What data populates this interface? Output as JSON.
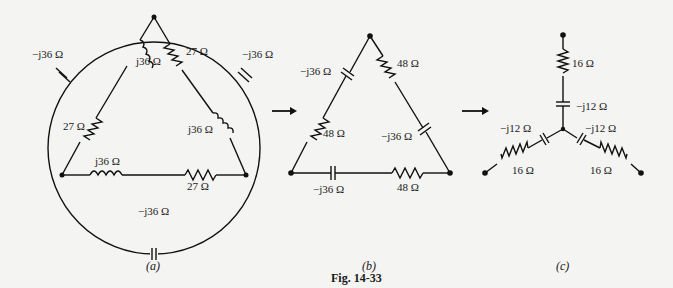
{
  "figure": {
    "caption": "Fig. 14-33",
    "panels": [
      {
        "id": "a",
        "label": "(a)",
        "elements": [
          {
            "type": "capacitor",
            "label": "−j36 Ω",
            "position": "circle upper-left"
          },
          {
            "type": "inductor",
            "label": "j36 Ω",
            "position": "left edge of triangle, upper"
          },
          {
            "type": "resistor",
            "label": "27 Ω",
            "position": "right edge of triangle, upper"
          },
          {
            "type": "capacitor",
            "label": "−j36 Ω",
            "position": "circle upper-right"
          },
          {
            "type": "resistor",
            "label": "27 Ω",
            "position": "left edge of triangle, lower"
          },
          {
            "type": "inductor",
            "label": "j36 Ω",
            "position": "right edge of triangle, lower"
          },
          {
            "type": "inductor",
            "label": "j36 Ω",
            "position": "bottom edge, left"
          },
          {
            "type": "resistor",
            "label": "27 Ω",
            "position": "bottom edge, right"
          },
          {
            "type": "capacitor",
            "label": "−j36 Ω",
            "position": "circle bottom"
          }
        ]
      },
      {
        "id": "b",
        "label": "(b)",
        "elements": [
          {
            "type": "capacitor",
            "label": "−j36 Ω",
            "position": "left edge, upper"
          },
          {
            "type": "resistor",
            "label": "48 Ω",
            "position": "right edge, upper"
          },
          {
            "type": "resistor",
            "label": "48 Ω",
            "position": "left edge, lower"
          },
          {
            "type": "capacitor",
            "label": "−j36 Ω",
            "position": "right edge, lower"
          },
          {
            "type": "capacitor",
            "label": "−j36 Ω",
            "position": "bottom edge, left"
          },
          {
            "type": "resistor",
            "label": "48 Ω",
            "position": "bottom edge, right"
          }
        ]
      },
      {
        "id": "c",
        "label": "(c)",
        "elements": [
          {
            "type": "resistor",
            "label": "16 Ω",
            "position": "top branch"
          },
          {
            "type": "capacitor",
            "label": "−j12 Ω",
            "position": "top branch"
          },
          {
            "type": "capacitor",
            "label": "−j12 Ω",
            "position": "left branch"
          },
          {
            "type": "resistor",
            "label": "16 Ω",
            "position": "left branch"
          },
          {
            "type": "capacitor",
            "label": "−j12 Ω",
            "position": "right branch"
          },
          {
            "type": "resistor",
            "label": "16 Ω",
            "position": "right branch"
          }
        ]
      }
    ],
    "labels": {
      "a_cap_ul": "−j36 Ω",
      "a_ind_l": "j36 Ω",
      "a_res_r": "27 Ω",
      "a_cap_ur": "−j36 Ω",
      "a_res_l": "27 Ω",
      "a_ind_r": "j36 Ω",
      "a_ind_b": "j36 Ω",
      "a_res_b": "27 Ω",
      "a_cap_b": "−j36 Ω",
      "b_cap_l": "−j36 Ω",
      "b_res_r": "48 Ω",
      "b_res_l": "48 Ω",
      "b_cap_r": "−j36 Ω",
      "b_cap_b": "−j36 Ω",
      "b_res_b": "48 Ω",
      "c_res_t": "16 Ω",
      "c_cap_t": "−j12 Ω",
      "c_cap_l": "−j12 Ω",
      "c_res_l": "16 Ω",
      "c_cap_r": "−j12 Ω",
      "c_res_r": "16 Ω",
      "panel_a": "(a)",
      "panel_b": "(b)",
      "panel_c": "(c)"
    },
    "arrows": 2
  }
}
